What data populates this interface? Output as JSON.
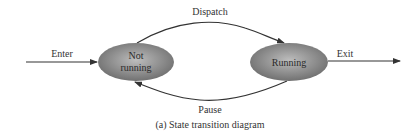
{
  "diagram": {
    "states": [
      {
        "id": "not_running",
        "label_lines": [
          "Not",
          "running"
        ]
      },
      {
        "id": "running",
        "label_lines": [
          "Running"
        ]
      }
    ],
    "transitions": [
      {
        "label": "Enter",
        "from": null,
        "to": "not_running"
      },
      {
        "label": "Dispatch",
        "from": "not_running",
        "to": "running"
      },
      {
        "label": "Pause",
        "from": "running",
        "to": "not_running"
      },
      {
        "label": "Exit",
        "from": "running",
        "to": null
      }
    ],
    "caption": "(a) State transition diagram",
    "colors": {
      "state_fill_center": "#b8b8b8",
      "state_fill_edge": "#6e6e6e",
      "line": "#333333"
    }
  }
}
